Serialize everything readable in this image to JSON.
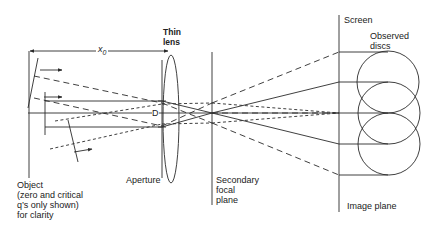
{
  "labels": {
    "distance": "x",
    "distance_sub": "0",
    "thin_lens": [
      "Thin",
      "lens"
    ],
    "screen": "Screen",
    "observed_discs": [
      "Observed",
      "discs"
    ],
    "aperture_diameter": "D",
    "aperture": "Aperture",
    "object": [
      "Object",
      "(zero and critical",
      "q’s only shown)",
      "for clarity"
    ],
    "secondary_focal_plane": [
      "Secondary",
      "focal",
      "plane"
    ],
    "image_plane": "Image plane"
  },
  "colors": {
    "ink": "#2a2a2a",
    "background": "#ffffff"
  }
}
